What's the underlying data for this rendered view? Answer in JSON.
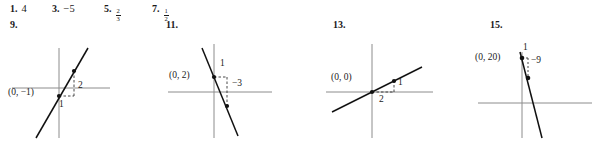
{
  "answers": [
    {
      "number": "1.",
      "value": "4",
      "is_fraction": false
    },
    {
      "number": "3.",
      "value": "−5",
      "is_fraction": false
    },
    {
      "number": "5.",
      "value": "2/3",
      "is_fraction": true,
      "numerator": "2",
      "denominator": "3"
    },
    {
      "number": "7.",
      "value": "1/2",
      "is_fraction": true,
      "numerator": "1",
      "denominator": "2"
    }
  ],
  "problems": [
    {
      "number": "9.",
      "point_label": "(0, −1)",
      "run_label": "1",
      "rise_label": "2",
      "intercept": "(0, -1)",
      "slope": "2"
    },
    {
      "number": "11.",
      "point_label": "(0, 2)",
      "run_label": "1",
      "rise_label": "−3",
      "intercept": "(0, 2)",
      "slope": "-3"
    },
    {
      "number": "13.",
      "point_label": "(0, 0)",
      "run_label": "2",
      "rise_label": "1",
      "intercept": "(0, 0)",
      "slope": "1/2"
    },
    {
      "number": "15.",
      "point_label": "(0, 20)",
      "run_label": "1",
      "rise_label": "−9",
      "intercept": "(0, 20)",
      "slope": "-9"
    }
  ],
  "colors": {
    "axis": "#8c8c8c",
    "line": "#111111",
    "text": "#1a1a1a",
    "background": "#ffffff"
  }
}
